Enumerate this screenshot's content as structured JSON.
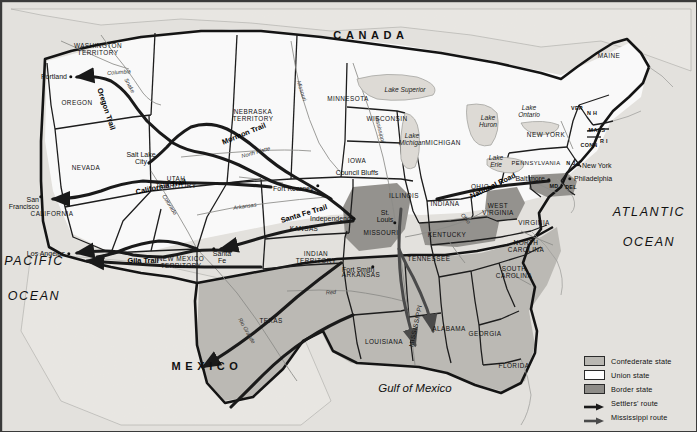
{
  "map": {
    "title": "The United States during the Civil War era",
    "countries": [
      {
        "name": "CANADA",
        "x": 370,
        "y": 35
      },
      {
        "name": "MEXICO",
        "x": 206,
        "y": 366
      }
    ],
    "oceans": [
      {
        "name": "ATLANTIC",
        "x": 648,
        "y": 212
      },
      {
        "name": "OCEAN",
        "x": 648,
        "y": 242
      },
      {
        "name": "PACIFIC",
        "x": 33,
        "y": 261
      },
      {
        "name": "OCEAN",
        "x": 33,
        "y": 296
      }
    ],
    "gulf": {
      "name": "Gulf of Mexico",
      "x": 414,
      "y": 387
    },
    "lakes": [
      {
        "name": "Lake Superior",
        "x": 404,
        "y": 89
      },
      {
        "name": "Lake\nMichigan",
        "x": 411,
        "y": 139
      },
      {
        "name": "Lake\nHuron",
        "x": 487,
        "y": 121
      },
      {
        "name": "Lake\nOntario",
        "x": 528,
        "y": 111
      },
      {
        "name": "Lake\nErie",
        "x": 495,
        "y": 161
      }
    ],
    "states": [
      {
        "name": "WASHINGTON\nTERRITORY",
        "x": 97,
        "y": 49
      },
      {
        "name": "OREGON",
        "x": 76,
        "y": 102
      },
      {
        "name": "NEVADA",
        "x": 85,
        "y": 167
      },
      {
        "name": "CALIFORNIA",
        "x": 51,
        "y": 213
      },
      {
        "name": "UTAH\nTERRITORY",
        "x": 175,
        "y": 182
      },
      {
        "name": "NEW MEXICO\nTERRITORY",
        "x": 180,
        "y": 262
      },
      {
        "name": "NEBRASKA\nTERRITORY",
        "x": 252,
        "y": 115
      },
      {
        "name": "MINNESOTA",
        "x": 347,
        "y": 98
      },
      {
        "name": "WISCONSIN",
        "x": 386,
        "y": 118
      },
      {
        "name": "MICHIGAN",
        "x": 442,
        "y": 142
      },
      {
        "name": "IOWA",
        "x": 356,
        "y": 160
      },
      {
        "name": "ILLINOIS",
        "x": 403,
        "y": 195
      },
      {
        "name": "INDIANA",
        "x": 444,
        "y": 203
      },
      {
        "name": "OHIO",
        "x": 479,
        "y": 186
      },
      {
        "name": "KANSAS",
        "x": 303,
        "y": 228
      },
      {
        "name": "MISSOURI",
        "x": 380,
        "y": 232
      },
      {
        "name": "INDIAN\nTERRITORY",
        "x": 315,
        "y": 257
      },
      {
        "name": "ARKANSAS",
        "x": 360,
        "y": 274
      },
      {
        "name": "TEXAS",
        "x": 270,
        "y": 320
      },
      {
        "name": "LOUISIANA",
        "x": 383,
        "y": 341
      },
      {
        "name": "MISSISSIPPI",
        "x": 415,
        "y": 325
      },
      {
        "name": "ALABAMA",
        "x": 448,
        "y": 328
      },
      {
        "name": "GEORGIA",
        "x": 484,
        "y": 333
      },
      {
        "name": "FLORIDA",
        "x": 513,
        "y": 365
      },
      {
        "name": "TENNESSEE",
        "x": 428,
        "y": 258
      },
      {
        "name": "KENTUCKY",
        "x": 446,
        "y": 234
      },
      {
        "name": "WEST\nVIRGINIA",
        "x": 497,
        "y": 209
      },
      {
        "name": "VIRGINIA",
        "x": 533,
        "y": 222
      },
      {
        "name": "NORTH\nCAROLINA",
        "x": 525,
        "y": 246
      },
      {
        "name": "SOUTH\nCAROLINA",
        "x": 513,
        "y": 272
      },
      {
        "name": "PENNSYLVANIA",
        "x": 535,
        "y": 162
      },
      {
        "name": "NEW YORK",
        "x": 545,
        "y": 134
      },
      {
        "name": "MAINE",
        "x": 608,
        "y": 55
      }
    ],
    "abbreviations": [
      {
        "name": "VER",
        "x": 576,
        "y": 108
      },
      {
        "name": "N H",
        "x": 591,
        "y": 113
      },
      {
        "name": "MASS",
        "x": 596,
        "y": 130
      },
      {
        "name": "CONN",
        "x": 588,
        "y": 145
      },
      {
        "name": "R I",
        "x": 603,
        "y": 141
      },
      {
        "name": "N J",
        "x": 570,
        "y": 163
      },
      {
        "name": "DEL",
        "x": 570,
        "y": 187
      },
      {
        "name": "MD",
        "x": 553,
        "y": 186
      }
    ],
    "cities": [
      {
        "name": "Portland",
        "x": 66,
        "y": 76,
        "align": "right",
        "dot": true,
        "dx": 70,
        "dy": 76
      },
      {
        "name": "San\nFrancisco",
        "x": 36,
        "y": 198,
        "align": "right",
        "dot": true,
        "dx": 40,
        "dy": 196
      },
      {
        "name": "Salt Lake\nCity",
        "x": 140,
        "y": 157,
        "align": "center",
        "dot": false
      },
      {
        "name": "Los Angeles",
        "x": 64,
        "y": 253,
        "align": "right",
        "dot": true,
        "dx": 68,
        "dy": 253
      },
      {
        "name": "Santa\nFe",
        "x": 221,
        "y": 253,
        "align": "center",
        "dot": true,
        "dx": 213,
        "dy": 248
      },
      {
        "name": "Fort Kearney",
        "x": 272,
        "y": 188,
        "align": "left",
        "dot": true,
        "dx": 317,
        "dy": 185
      },
      {
        "name": "Council Bluffs",
        "x": 356,
        "y": 172,
        "align": "center",
        "dot": false
      },
      {
        "name": "Independence",
        "x": 309,
        "y": 218,
        "align": "left",
        "dot": true,
        "dx": 353,
        "dy": 218
      },
      {
        "name": "Fort Smith",
        "x": 341,
        "y": 269,
        "align": "left",
        "dot": true,
        "dx": 372,
        "dy": 266
      },
      {
        "name": "St.\nLouis",
        "x": 384,
        "y": 215,
        "align": "center",
        "dot": true,
        "dx": 394,
        "dy": 222
      },
      {
        "name": "New York",
        "x": 581,
        "y": 165,
        "align": "left",
        "dot": true,
        "dx": 577,
        "dy": 164
      },
      {
        "name": "Philadelphia",
        "x": 573,
        "y": 178,
        "align": "left",
        "dot": true,
        "dx": 569,
        "dy": 178
      },
      {
        "name": "Baltimore",
        "x": 544,
        "y": 178,
        "align": "right",
        "dot": true,
        "dx": 548,
        "dy": 179
      }
    ],
    "trails": [
      {
        "name": "Oregon Trail",
        "x": 105,
        "y": 108,
        "rot": 72
      },
      {
        "name": "California Trail",
        "x": 160,
        "y": 186,
        "rot": -12
      },
      {
        "name": "Mormon  Trail",
        "x": 243,
        "y": 133,
        "rot": -22
      },
      {
        "name": "Santa Fe Trail",
        "x": 303,
        "y": 213,
        "rot": -17
      },
      {
        "name": "Gila Trail",
        "x": 142,
        "y": 260,
        "rot": 0
      },
      {
        "name": "National  Road",
        "x": 492,
        "y": 185,
        "rot": -26
      }
    ],
    "rivers": [
      {
        "name": "Snake",
        "x": 128,
        "y": 85,
        "rot": 62
      },
      {
        "name": "Columbia",
        "x": 118,
        "y": 72,
        "rot": -4
      },
      {
        "name": "Colorado",
        "x": 168,
        "y": 204,
        "rot": 58
      },
      {
        "name": "Rio Grande",
        "x": 245,
        "y": 330,
        "rot": 60
      },
      {
        "name": "Arkansas",
        "x": 244,
        "y": 206,
        "rot": -8
      },
      {
        "name": "North Platte",
        "x": 255,
        "y": 152,
        "rot": -16
      },
      {
        "name": "Missouri",
        "x": 300,
        "y": 90,
        "rot": 72
      },
      {
        "name": "Mississippi",
        "x": 378,
        "y": 128,
        "rot": 76
      },
      {
        "name": "Ohio",
        "x": 464,
        "y": 218,
        "rot": 50
      },
      {
        "name": "Red",
        "x": 330,
        "y": 292,
        "rot": -5
      }
    ],
    "legend": {
      "items": [
        {
          "label": "Confederate state",
          "swatch": "confederate",
          "color": "#b9b7b2",
          "kind": "swatch"
        },
        {
          "label": "Union state",
          "swatch": "union",
          "color": "#ffffff",
          "kind": "swatch"
        },
        {
          "label": "Border state",
          "swatch": "border",
          "color": "#8e8c88",
          "kind": "swatch"
        },
        {
          "label": "Settlers' route",
          "swatch": "settlers",
          "color": "#1a1a1a",
          "kind": "arrow"
        },
        {
          "label": "Mississippi route",
          "swatch": "mississippi",
          "color": "#4a4a4a",
          "kind": "arrow"
        }
      ]
    },
    "colors": {
      "confederate": "#b9b7b2",
      "union": "#ffffff",
      "border_state": "#8e8c88",
      "sea": "#dedbd6",
      "land_foreign": "#e3e1dc",
      "outline": "#1c1c1c",
      "settlers_route": "#1a1a1a",
      "mississippi_route": "#4a4a4a"
    }
  }
}
